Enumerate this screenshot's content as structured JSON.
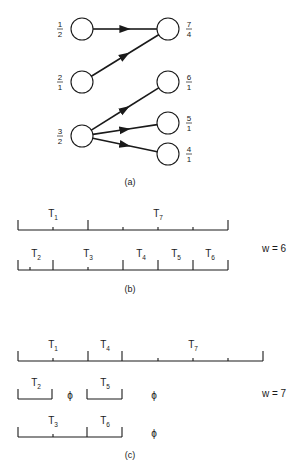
{
  "part_a": {
    "caption": "(a)",
    "nodes": [
      {
        "id": "n1",
        "x": 82,
        "y": 29,
        "label_num": "1",
        "label_den": "2",
        "side": "left"
      },
      {
        "id": "n2",
        "x": 82,
        "y": 82,
        "label_num": "2",
        "label_den": "1",
        "side": "left"
      },
      {
        "id": "n3",
        "x": 82,
        "y": 136,
        "label_num": "3",
        "label_den": "2",
        "side": "left"
      },
      {
        "id": "n7",
        "x": 168,
        "y": 29,
        "label_num": "7",
        "label_den": "4",
        "side": "right"
      },
      {
        "id": "n6",
        "x": 168,
        "y": 82,
        "label_num": "6",
        "label_den": "1",
        "side": "right"
      },
      {
        "id": "n5",
        "x": 168,
        "y": 123,
        "label_num": "5",
        "label_den": "1",
        "side": "right"
      },
      {
        "id": "n4",
        "x": 168,
        "y": 154,
        "label_num": "4",
        "label_den": "1",
        "side": "right"
      }
    ],
    "edges": [
      {
        "from": "n1",
        "to": "n7"
      },
      {
        "from": "n2",
        "to": "n7"
      },
      {
        "from": "n3",
        "to": "n6"
      },
      {
        "from": "n3",
        "to": "n5"
      },
      {
        "from": "n3",
        "to": "n4"
      }
    ]
  },
  "part_b": {
    "caption": "(b)",
    "width_label": "w = 6",
    "rows": [
      {
        "y": 230,
        "x0": 18,
        "x1": 228,
        "tall_ticks": [
          18,
          88,
          228
        ],
        "small_ticks": [
          53,
          123,
          158,
          193
        ],
        "tasks": [
          {
            "name": "T",
            "sub": "1",
            "x": 53
          },
          {
            "name": "T",
            "sub": "7",
            "x": 158
          }
        ]
      },
      {
        "y": 270,
        "x0": 18,
        "x1": 228,
        "tall_ticks": [
          18,
          53,
          123,
          158,
          193,
          228
        ],
        "small_ticks": [
          30,
          88
        ],
        "tasks": [
          {
            "name": "T",
            "sub": "2",
            "x": 36
          },
          {
            "name": "T",
            "sub": "3",
            "x": 88
          },
          {
            "name": "T",
            "sub": "4",
            "x": 141
          },
          {
            "name": "T",
            "sub": "5",
            "x": 176
          },
          {
            "name": "T",
            "sub": "6",
            "x": 210
          }
        ]
      }
    ]
  },
  "part_c": {
    "caption": "(c)",
    "width_label": "w = 7",
    "rows": [
      {
        "y": 361,
        "segments": [
          {
            "x0": 18,
            "x1": 263
          }
        ],
        "tall_ticks": [
          18,
          88,
          122,
          263
        ],
        "small_ticks": [
          53,
          158,
          193,
          228
        ],
        "tasks": [
          {
            "name": "T",
            "sub": "1",
            "x": 53
          },
          {
            "name": "T",
            "sub": "4",
            "x": 105
          },
          {
            "name": "T",
            "sub": "7",
            "x": 193
          }
        ],
        "idle": []
      },
      {
        "y": 399,
        "segments": [
          {
            "x0": 18,
            "x1": 52
          },
          {
            "x0": 87,
            "x1": 122
          }
        ],
        "tall_ticks": [
          18,
          52,
          87,
          122
        ],
        "small_ticks": [],
        "tasks": [
          {
            "name": "T",
            "sub": "2",
            "x": 36
          },
          {
            "name": "T",
            "sub": "5",
            "x": 105
          }
        ],
        "idle": [
          {
            "symbol": "ϕ",
            "x": 70
          },
          {
            "symbol": "ϕ",
            "x": 154
          }
        ]
      },
      {
        "y": 437,
        "segments": [
          {
            "x0": 18,
            "x1": 122
          }
        ],
        "tall_ticks": [
          18,
          87,
          122
        ],
        "small_ticks": [
          53
        ],
        "tasks": [
          {
            "name": "T",
            "sub": "3",
            "x": 53
          },
          {
            "name": "T",
            "sub": "6",
            "x": 105
          }
        ],
        "idle": [
          {
            "symbol": "ϕ",
            "x": 154
          }
        ]
      }
    ]
  },
  "style": {
    "ink": "#1a1a1a",
    "background": "#ffffff"
  }
}
